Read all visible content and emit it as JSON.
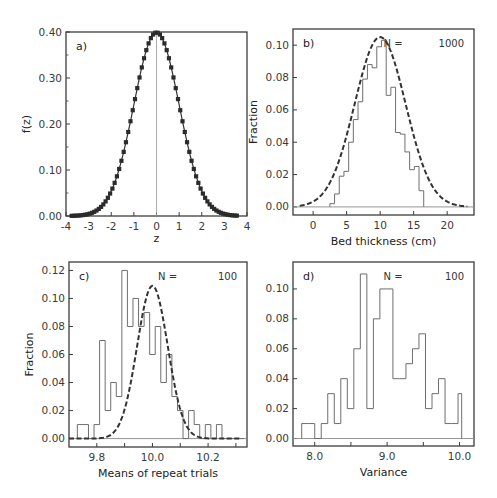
{
  "chart_data": [
    {
      "id": "a",
      "type": "line",
      "panel_label": "a)",
      "title": "",
      "xlabel": "z",
      "ylabel": "f(z)",
      "xlim": [
        -4,
        4
      ],
      "ylim": [
        0,
        0.4
      ],
      "xticks": [
        -4,
        -3,
        -2,
        -1,
        0,
        1,
        2,
        3,
        4
      ],
      "xtick_labels": [
        "-4",
        "-3",
        "-2",
        "-1",
        "0",
        "1",
        "2",
        "3",
        "4"
      ],
      "yticks": [
        0,
        0.1,
        0.2,
        0.3,
        0.4
      ],
      "ytick_labels": [
        "0.00",
        "0.10",
        "0.20",
        "0.30",
        "0.40"
      ],
      "series": [
        {
          "name": "standard normal pdf",
          "style": "solid line with square markers",
          "function": "normal",
          "mean": 0,
          "sd": 1,
          "x_start": -3.75,
          "x_end": 3.6,
          "step": 0.1
        }
      ],
      "vline": 0,
      "grid": false,
      "frame_px": {
        "left": 66,
        "top": 32,
        "right": 247,
        "bottom": 216
      }
    },
    {
      "id": "b",
      "type": "bar",
      "subtype": "step-histogram",
      "panel_label": "b)",
      "annotation": {
        "n_label": "N =",
        "n_value": "1000"
      },
      "xlabel": "Bed thickness (cm)",
      "ylabel": "Fraction",
      "xlim": [
        -3,
        24
      ],
      "ylim": [
        -0.005,
        0.11
      ],
      "xticks": [
        0,
        5,
        10,
        15,
        20
      ],
      "xtick_labels": [
        "0",
        "5",
        "10",
        "15",
        "20"
      ],
      "yticks": [
        0,
        0.02,
        0.04,
        0.06,
        0.08,
        0.1
      ],
      "ytick_labels": [
        "0.00",
        "0.02",
        "0.04",
        "0.06",
        "0.08",
        "0.10"
      ],
      "bin_edges": [
        2.5,
        3.2,
        3.9,
        4.6,
        5.3,
        6.0,
        6.7,
        7.4,
        8.1,
        8.8,
        9.5,
        10.2,
        10.9,
        11.6,
        12.3,
        13.0,
        13.7,
        14.4,
        15.1,
        15.8,
        16.5
      ],
      "values": [
        0.002,
        0.008,
        0.019,
        0.022,
        0.04,
        0.054,
        0.065,
        0.079,
        0.088,
        0.086,
        0.099,
        0.103,
        0.069,
        0.074,
        0.046,
        0.045,
        0.034,
        0.023,
        0.025,
        0.01
      ],
      "fit": {
        "name": "normal fit",
        "style": "dashed",
        "function": "normal",
        "mean": 10.0,
        "sd": 3.8,
        "peak": 0.105,
        "x_start": -2,
        "x_end": 23
      },
      "grid": false,
      "frame_px": {
        "left": 293,
        "top": 29,
        "right": 474,
        "bottom": 215
      }
    },
    {
      "id": "c",
      "type": "bar",
      "subtype": "step-histogram",
      "panel_label": "c)",
      "annotation": {
        "n_label": "N =",
        "n_value": "100"
      },
      "xlabel": "Means of repeat trials",
      "ylabel": "Fraction",
      "xlim": [
        9.7,
        10.34
      ],
      "ylim": [
        -0.006,
        0.126
      ],
      "xticks": [
        9.8,
        9.9,
        10.0,
        10.1,
        10.2,
        10.3
      ],
      "xtick_labels": [
        "9.8",
        "",
        "10.0",
        "",
        "10.2",
        ""
      ],
      "yticks": [
        0,
        0.02,
        0.04,
        0.06,
        0.08,
        0.1,
        0.12
      ],
      "ytick_labels": [
        "0.00",
        "0.02",
        "0.04",
        "0.06",
        "0.08",
        "0.10",
        "0.12"
      ],
      "bin_edges": [
        9.73,
        9.75,
        9.77,
        9.79,
        9.81,
        9.83,
        9.85,
        9.87,
        9.89,
        9.91,
        9.93,
        9.95,
        9.97,
        9.99,
        10.01,
        10.03,
        10.05,
        10.07,
        10.09,
        10.11,
        10.13,
        10.15,
        10.17,
        10.19,
        10.21,
        10.23,
        10.25,
        10.27,
        10.29,
        10.31,
        10.33
      ],
      "values": [
        0.01,
        0.01,
        0.0,
        0.01,
        0.07,
        0.02,
        0.04,
        0.03,
        0.12,
        0.08,
        0.1,
        0.08,
        0.09,
        0.06,
        0.08,
        0.04,
        0.06,
        0.03,
        0.02,
        0.0,
        0.02,
        0.01,
        0.0,
        0.01,
        0.0,
        0.01,
        0.0,
        0.0,
        0.0,
        0.0
      ],
      "values_note": "last visible bars: 10.25-10.27 = 0.01, 10.31-10.33 = 0.01",
      "fit": {
        "name": "normal fit",
        "style": "dashed",
        "function": "normal",
        "mean": 10.0,
        "sd": 0.055,
        "peak": 0.109,
        "x_start": 9.7,
        "x_end": 10.32
      },
      "grid": false,
      "frame_px": {
        "left": 69,
        "top": 262,
        "right": 247,
        "bottom": 447
      }
    },
    {
      "id": "d",
      "type": "bar",
      "subtype": "step-histogram",
      "panel_label": "d)",
      "annotation": {
        "n_label": "N =",
        "n_value": "100"
      },
      "xlabel": "Variance",
      "ylabel": "",
      "xlim": [
        7.7,
        10.2
      ],
      "ylim": [
        -0.005,
        0.118
      ],
      "xticks": [
        8.0,
        8.5,
        9.0,
        9.5,
        10.0
      ],
      "xtick_labels": [
        "8.0",
        "",
        "9.0",
        "",
        "10.0"
      ],
      "yticks": [
        0,
        0.02,
        0.04,
        0.06,
        0.08,
        0.1
      ],
      "ytick_labels": [
        "0.00",
        "0.02",
        "0.04",
        "0.06",
        "0.08",
        "0.10"
      ],
      "bin_edges": [
        7.82,
        7.91,
        8.0,
        8.09,
        8.18,
        8.27,
        8.36,
        8.45,
        8.54,
        8.63,
        8.72,
        8.81,
        8.9,
        8.99,
        9.08,
        9.17,
        9.26,
        9.35,
        9.44,
        9.53,
        9.62,
        9.71,
        9.8,
        9.89,
        9.98,
        10.03
      ],
      "values": [
        0.01,
        0.01,
        0.0,
        0.01,
        0.03,
        0.01,
        0.04,
        0.02,
        0.06,
        0.11,
        0.02,
        0.08,
        0.1,
        0.1,
        0.04,
        0.04,
        0.05,
        0.06,
        0.07,
        0.02,
        0.03,
        0.04,
        0.01,
        0.01,
        0.03
      ],
      "grid": false,
      "frame_px": {
        "left": 293,
        "top": 262,
        "right": 474,
        "bottom": 446
      }
    }
  ],
  "style": {
    "line_color": "#333333",
    "hist_color": "#6e6e6e",
    "frame_color": "#3c3c3c",
    "baseline_color": "#888888",
    "marker_color": "#2b2b2b"
  }
}
